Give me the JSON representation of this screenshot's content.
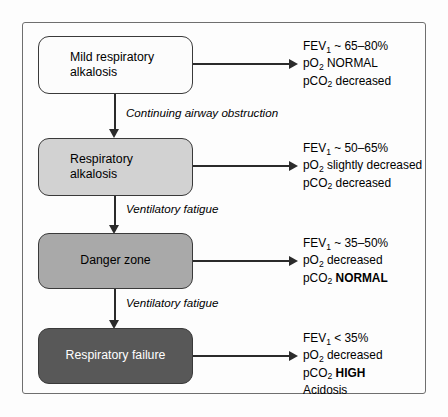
{
  "figure": {
    "colors": {
      "box_stage_1": "#fcfcfc",
      "box_stage_2": "#d2d2d2",
      "box_stage_3": "#a9a9a9",
      "box_stage_4": "#585858",
      "border": "#3a3a3a",
      "arrow": "#2b2b2b",
      "text_dark": "#000000",
      "text_light": "#ffffff"
    }
  },
  "stages": [
    {
      "label": "Mild respiratory\nalkalosis"
    },
    {
      "label": "Respiratory\nalkalosis"
    },
    {
      "label": "Danger zone"
    },
    {
      "label": "Respiratory failure"
    }
  ],
  "transitions": [
    {
      "label": "Continuing airway obstruction"
    },
    {
      "label": "Ventilatory fatigue"
    },
    {
      "label": "Ventilatory fatigue"
    }
  ],
  "annotations": [
    {
      "fev_label": "FEV",
      "fev_sub": "1",
      "fev_value": " ~ 65–80%",
      "po2_label": "pO",
      "po2_sub": "2",
      "po2_value": " NORMAL",
      "pco2_label": "pCO",
      "pco2_sub": "2",
      "pco2_value": " decreased",
      "pco2_bold": "",
      "extra": ""
    },
    {
      "fev_label": "FEV",
      "fev_sub": "1",
      "fev_value": " ~ 50–65%",
      "po2_label": "pO",
      "po2_sub": "2",
      "po2_value": " slightly decreased",
      "pco2_label": "pCO",
      "pco2_sub": "2",
      "pco2_value": " decreased",
      "pco2_bold": "",
      "extra": ""
    },
    {
      "fev_label": "FEV",
      "fev_sub": "1",
      "fev_value": " ~ 35–50%",
      "po2_label": "pO",
      "po2_sub": "2",
      "po2_value": " decreased",
      "pco2_label": "pCO",
      "pco2_sub": "2",
      "pco2_value": " ",
      "pco2_bold": "NORMAL",
      "extra": ""
    },
    {
      "fev_label": "FEV",
      "fev_sub": "1",
      "fev_value": " < 35%",
      "po2_label": "pO",
      "po2_sub": "2",
      "po2_value": " decreased",
      "pco2_label": "pCO",
      "pco2_sub": "2",
      "pco2_value": " ",
      "pco2_bold": "HIGH",
      "extra": "Acidosis"
    }
  ]
}
